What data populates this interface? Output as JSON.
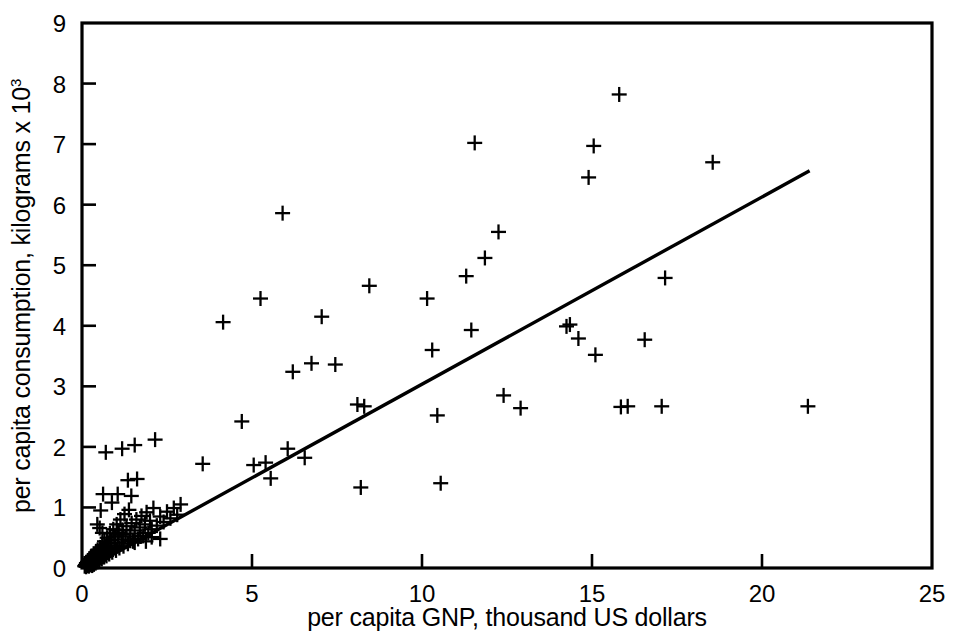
{
  "chart_data": {
    "type": "scatter",
    "title": "",
    "xlabel": "per capita GNP, thousand US dollars",
    "ylabel": "per capita consumption, kilograms x 10",
    "ylabel_superscript": "3",
    "xlim": [
      0,
      25
    ],
    "ylim": [
      0,
      9
    ],
    "xticks": [
      0,
      5,
      10,
      15,
      20,
      25
    ],
    "yticks": [
      0,
      1,
      2,
      3,
      4,
      5,
      6,
      7,
      8,
      9
    ],
    "xticklabels": [
      "0",
      "5",
      "10",
      "15",
      "20",
      "25"
    ],
    "yticklabels": [
      "0",
      "1",
      "2",
      "3",
      "4",
      "5",
      "6",
      "7",
      "8",
      "9"
    ],
    "grid": false,
    "legend": false,
    "marker_style": "plus",
    "marker_color": "#000000",
    "series": [
      {
        "name": "countries",
        "points": [
          [
            0.08,
            0.03
          ],
          [
            0.1,
            0.05
          ],
          [
            0.12,
            0.02
          ],
          [
            0.13,
            0.08
          ],
          [
            0.15,
            0.04
          ],
          [
            0.16,
            0.1
          ],
          [
            0.18,
            0.06
          ],
          [
            0.19,
            0.12
          ],
          [
            0.2,
            0.03
          ],
          [
            0.21,
            0.09
          ],
          [
            0.22,
            0.15
          ],
          [
            0.24,
            0.05
          ],
          [
            0.25,
            0.11
          ],
          [
            0.26,
            0.18
          ],
          [
            0.27,
            0.07
          ],
          [
            0.28,
            0.14
          ],
          [
            0.3,
            0.04
          ],
          [
            0.31,
            0.2
          ],
          [
            0.32,
            0.09
          ],
          [
            0.33,
            0.16
          ],
          [
            0.35,
            0.06
          ],
          [
            0.36,
            0.23
          ],
          [
            0.37,
            0.12
          ],
          [
            0.38,
            0.19
          ],
          [
            0.4,
            0.08
          ],
          [
            0.41,
            0.26
          ],
          [
            0.42,
            0.14
          ],
          [
            0.44,
            0.21
          ],
          [
            0.45,
            0.1
          ],
          [
            0.46,
            0.3
          ],
          [
            0.48,
            0.17
          ],
          [
            0.5,
            0.24
          ],
          [
            0.51,
            0.12
          ],
          [
            0.53,
            0.34
          ],
          [
            0.54,
            0.19
          ],
          [
            0.56,
            0.27
          ],
          [
            0.58,
            0.15
          ],
          [
            0.6,
            0.38
          ],
          [
            0.61,
            0.22
          ],
          [
            0.63,
            0.31
          ],
          [
            0.65,
            0.18
          ],
          [
            0.66,
            0.44
          ],
          [
            0.68,
            0.25
          ],
          [
            0.7,
            0.36
          ],
          [
            0.72,
            0.2
          ],
          [
            0.74,
            0.5
          ],
          [
            0.76,
            0.29
          ],
          [
            0.78,
            0.41
          ],
          [
            0.8,
            0.23
          ],
          [
            0.82,
            0.57
          ],
          [
            0.85,
            0.33
          ],
          [
            0.87,
            0.46
          ],
          [
            0.89,
            0.26
          ],
          [
            0.92,
            0.64
          ],
          [
            0.95,
            0.37
          ],
          [
            0.97,
            0.52
          ],
          [
            1.0,
            0.29
          ],
          [
            1.02,
            0.72
          ],
          [
            1.05,
            0.42
          ],
          [
            1.08,
            0.58
          ],
          [
            1.1,
            0.33
          ],
          [
            1.13,
            0.8
          ],
          [
            1.16,
            0.47
          ],
          [
            1.19,
            0.63
          ],
          [
            1.22,
            0.36
          ],
          [
            1.25,
            0.89
          ],
          [
            1.28,
            0.52
          ],
          [
            1.31,
            0.69
          ],
          [
            1.35,
            0.4
          ],
          [
            1.38,
            0.96
          ],
          [
            1.42,
            0.57
          ],
          [
            1.46,
            0.74
          ],
          [
            1.5,
            0.44
          ],
          [
            1.55,
            0.62
          ],
          [
            1.6,
            0.8
          ],
          [
            1.65,
            0.48
          ],
          [
            1.7,
            0.67
          ],
          [
            1.75,
            0.86
          ],
          [
            1.8,
            0.53
          ],
          [
            1.85,
            0.72
          ],
          [
            1.9,
            0.92
          ],
          [
            1.95,
            0.58
          ],
          [
            2.0,
            0.78
          ],
          [
            2.05,
            0.64
          ],
          [
            2.1,
            0.99
          ],
          [
            2.2,
            0.7
          ],
          [
            2.3,
            0.85
          ],
          [
            2.4,
            0.76
          ],
          [
            2.5,
            0.93
          ],
          [
            2.6,
            0.82
          ],
          [
            2.7,
            0.99
          ],
          [
            2.8,
            0.88
          ],
          [
            2.9,
            1.05
          ],
          [
            0.55,
            0.95
          ],
          [
            0.62,
            1.22
          ],
          [
            0.7,
            1.91
          ],
          [
            0.88,
            1.08
          ],
          [
            1.05,
            1.22
          ],
          [
            1.18,
            1.97
          ],
          [
            1.35,
            1.45
          ],
          [
            1.45,
            1.19
          ],
          [
            1.55,
            2.03
          ],
          [
            1.62,
            1.47
          ],
          [
            2.15,
            2.12
          ],
          [
            1.05,
            0.62
          ],
          [
            1.2,
            0.55
          ],
          [
            1.42,
            0.45
          ],
          [
            1.55,
            0.42
          ],
          [
            1.72,
            0.52
          ],
          [
            1.88,
            0.44
          ],
          [
            2.05,
            0.51
          ],
          [
            2.3,
            0.48
          ],
          [
            0.45,
            0.72
          ],
          [
            0.52,
            0.66
          ],
          [
            0.6,
            0.58
          ],
          [
            3.55,
            1.72
          ],
          [
            4.15,
            4.06
          ],
          [
            4.7,
            2.42
          ],
          [
            5.05,
            1.7
          ],
          [
            5.25,
            4.45
          ],
          [
            5.4,
            1.74
          ],
          [
            5.55,
            1.48
          ],
          [
            5.9,
            5.86
          ],
          [
            6.05,
            1.97
          ],
          [
            6.2,
            3.24
          ],
          [
            6.55,
            1.82
          ],
          [
            6.75,
            3.38
          ],
          [
            7.05,
            4.15
          ],
          [
            7.45,
            3.36
          ],
          [
            8.1,
            2.7
          ],
          [
            8.3,
            2.67
          ],
          [
            8.45,
            4.66
          ],
          [
            8.2,
            1.33
          ],
          [
            10.15,
            4.45
          ],
          [
            10.3,
            3.6
          ],
          [
            10.45,
            2.52
          ],
          [
            10.55,
            1.4
          ],
          [
            11.3,
            4.82
          ],
          [
            11.45,
            3.93
          ],
          [
            11.55,
            7.02
          ],
          [
            11.85,
            5.12
          ],
          [
            12.25,
            5.55
          ],
          [
            12.4,
            2.85
          ],
          [
            12.9,
            2.64
          ],
          [
            14.25,
            3.99
          ],
          [
            14.35,
            4.02
          ],
          [
            14.6,
            3.79
          ],
          [
            14.9,
            6.45
          ],
          [
            15.05,
            6.97
          ],
          [
            15.1,
            3.52
          ],
          [
            15.8,
            7.82
          ],
          [
            15.85,
            2.66
          ],
          [
            16.05,
            2.67
          ],
          [
            16.55,
            3.77
          ],
          [
            17.05,
            2.67
          ],
          [
            17.15,
            4.79
          ],
          [
            18.55,
            6.7
          ],
          [
            21.35,
            2.67
          ]
        ]
      }
    ],
    "fit_line": {
      "name": "regression line",
      "x_start": 0.25,
      "y_start": 0.02,
      "x_end": 21.4,
      "y_end": 6.56
    }
  }
}
